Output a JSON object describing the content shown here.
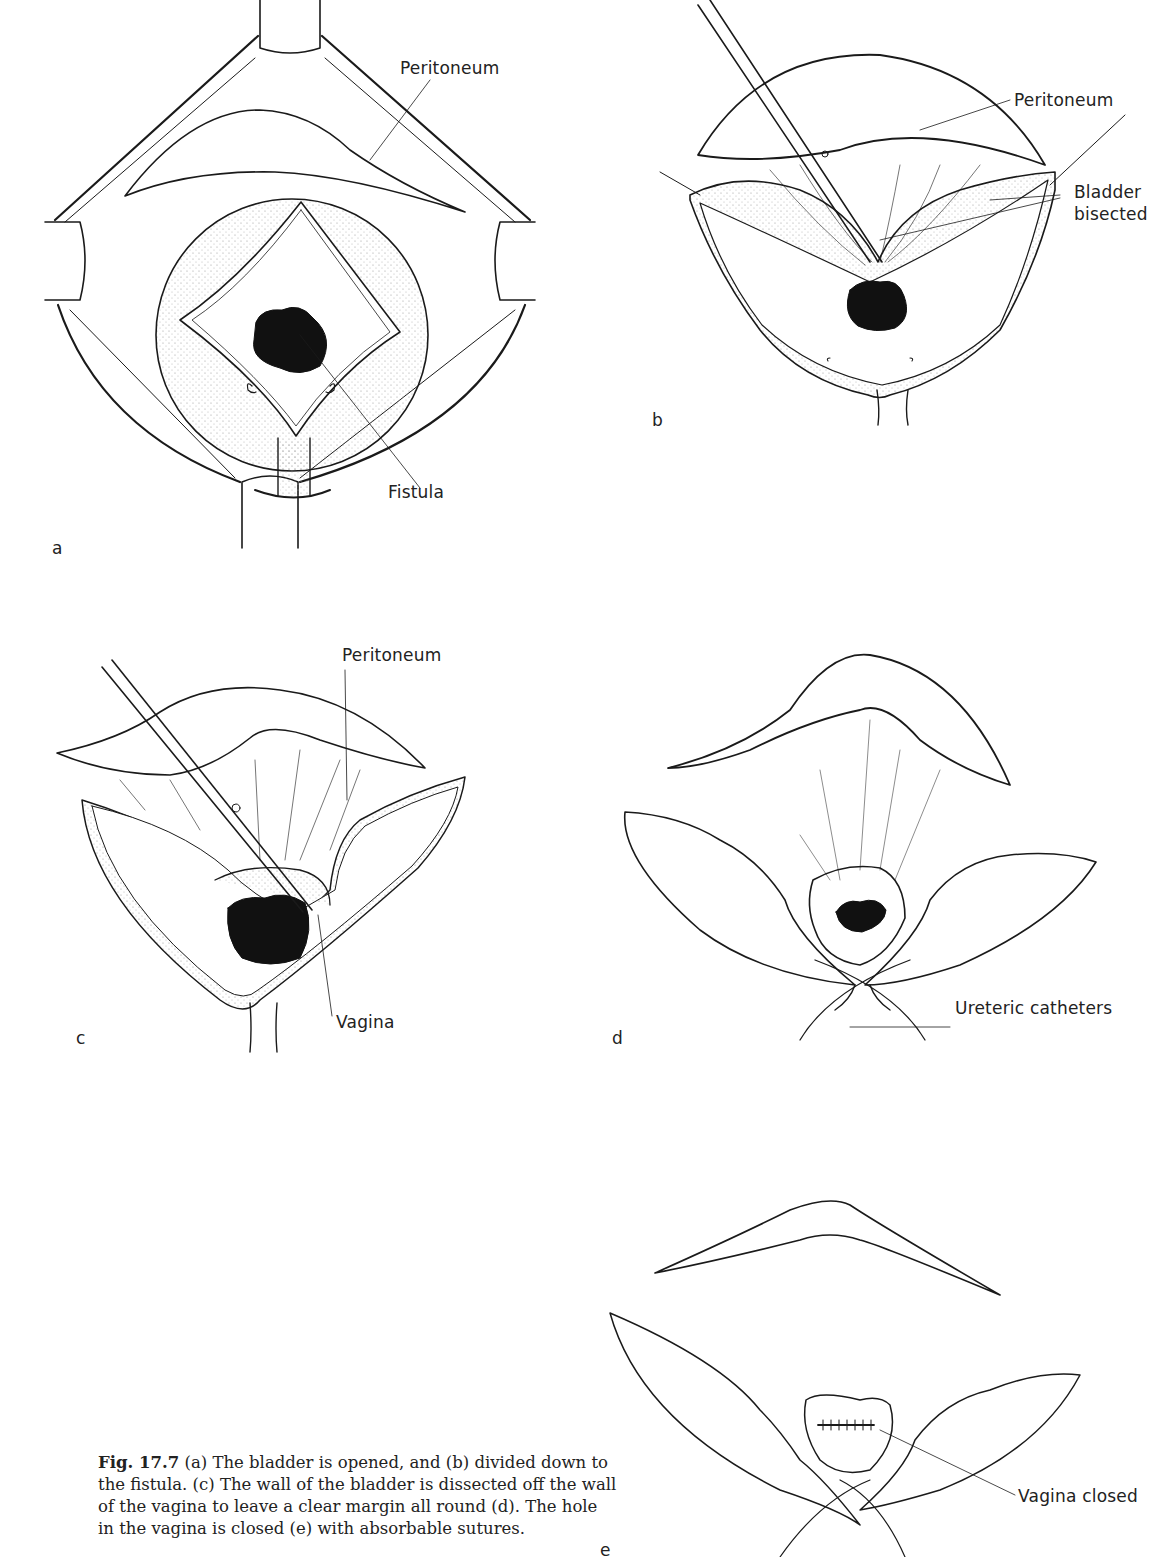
{
  "figure": {
    "number": "Fig. 17.7",
    "panels": [
      {
        "id": "a",
        "letter": "a",
        "labels": [
          "Peritoneum",
          "Fistula"
        ]
      },
      {
        "id": "b",
        "letter": "b",
        "labels": [
          "Peritoneum",
          "Bladder",
          "bisected"
        ]
      },
      {
        "id": "c",
        "letter": "c",
        "labels": [
          "Peritoneum",
          "Vagina"
        ]
      },
      {
        "id": "d",
        "letter": "d",
        "labels": [
          "Ureteric catheters"
        ]
      },
      {
        "id": "e",
        "letter": "e",
        "labels": [
          "Vagina closed"
        ]
      }
    ],
    "caption": {
      "label": "Fig. 17.7",
      "text": " (a) The bladder is opened, and (b) divided down to the fistula. (c) The wall of the bladder is dissected off the wall of the vagina to leave a clear margin all round (d). The hole in the vagina is closed (e) with absorbable sutures."
    }
  }
}
